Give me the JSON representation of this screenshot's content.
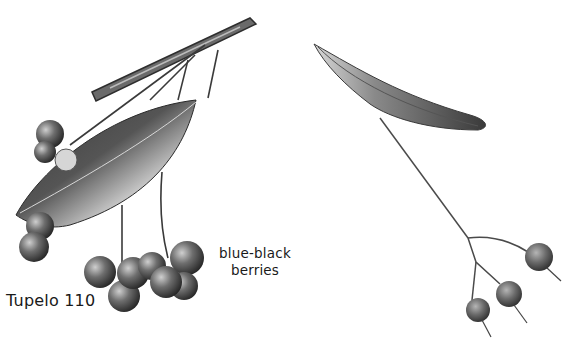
{
  "page": {
    "background": "#ffffff"
  },
  "labels": {
    "species": "Tupelo 110",
    "berries_line1": "blue-black",
    "berries_line2": "berries"
  },
  "specimens": [
    {
      "name": "tupelo-twig",
      "parts": [
        "twig",
        "leaf",
        "berry-cluster"
      ],
      "tone": "grayscale"
    },
    {
      "name": "basswood-fruit-bract",
      "parts": [
        "bract",
        "stalk",
        "nutlets"
      ],
      "tone": "grayscale"
    }
  ],
  "colors": {
    "ink": "#1a1a1a",
    "dark": "#2e2e2e",
    "mid": "#6b6b6b",
    "light": "#bdbdbd"
  }
}
